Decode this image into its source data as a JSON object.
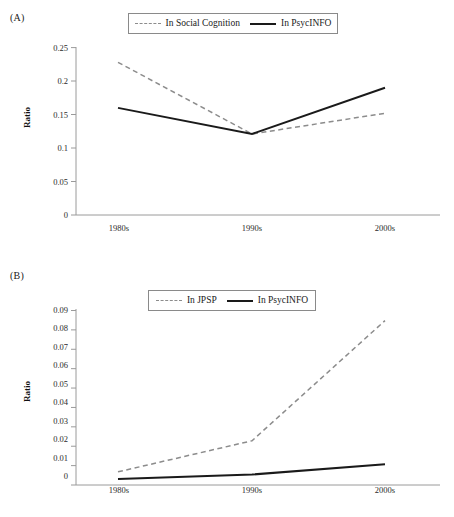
{
  "figure": {
    "panels": [
      {
        "id": "A",
        "label": "(A)",
        "ylabel": "Ratio",
        "legend": [
          {
            "name": "In Social Cognition",
            "style": "dashed"
          },
          {
            "name": "In PsycINFO",
            "style": "solid"
          }
        ],
        "chart_data": {
          "type": "line",
          "title": "",
          "xlabel": "",
          "ylabel": "Ratio",
          "categories": [
            "1980s",
            "1990s",
            "2000s"
          ],
          "yticks": [
            0,
            0.05,
            0.1,
            0.15,
            0.2,
            0.25
          ],
          "ytick_labels": [
            "0",
            "0.05",
            "0.1",
            "0.15",
            "0.2",
            "0.25"
          ],
          "ylim": [
            0,
            0.25
          ],
          "grid": false,
          "legend_position": "top-center",
          "series": [
            {
              "name": "In Social Cognition",
              "style": "dashed",
              "color": "#8c8c8c",
              "values": [
                0.228,
                0.121,
                0.152
              ]
            },
            {
              "name": "In PsycINFO",
              "style": "solid",
              "color": "#1a1a1a",
              "values": [
                0.16,
                0.121,
                0.19
              ]
            }
          ]
        }
      },
      {
        "id": "B",
        "label": "(B)",
        "ylabel": "Ratio",
        "legend": [
          {
            "name": "In JPSP",
            "style": "dashed"
          },
          {
            "name": "In PsycINFO",
            "style": "solid"
          }
        ],
        "chart_data": {
          "type": "line",
          "title": "",
          "xlabel": "",
          "ylabel": "Ratio",
          "categories": [
            "1980s",
            "1990s",
            "2000s"
          ],
          "yticks": [
            0,
            0.01,
            0.02,
            0.03,
            0.04,
            0.05,
            0.06,
            0.07,
            0.08,
            0.09
          ],
          "ytick_labels": [
            "0",
            "0.01",
            "0.02",
            "0.03",
            "0.04",
            "0.05",
            "0.06",
            "0.07",
            "0.08",
            "0.09"
          ],
          "ylim": [
            0,
            0.09
          ],
          "grid": false,
          "legend_position": "top-center",
          "series": [
            {
              "name": "In JPSP",
              "style": "dashed",
              "color": "#8c8c8c",
              "values": [
                0.0068,
                0.0228,
                0.0848
              ]
            },
            {
              "name": "In PsycINFO",
              "style": "solid",
              "color": "#1a1a1a",
              "values": [
                0.0031,
                0.0054,
                0.0107
              ]
            }
          ]
        }
      }
    ]
  }
}
